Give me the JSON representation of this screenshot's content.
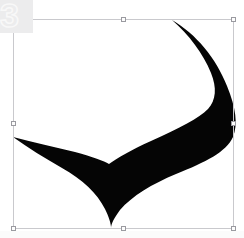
{
  "app": {
    "surface_name": "vector-canvas",
    "background_color": "#ffffff"
  },
  "watermark": {
    "label": "3",
    "block_color": "#ececed",
    "text_color": "#f8f8f8"
  },
  "selection": {
    "label": "",
    "stroke_color": "#c9c9cd",
    "handle_fill": "#fdfdfd",
    "handle_stroke": "#9a9aa0",
    "bounds": {
      "x": 13,
      "y": 19,
      "width": 221,
      "height": 210
    },
    "handles": [
      {
        "name": "handle-top-left",
        "position": "nw"
      },
      {
        "name": "handle-top-center",
        "position": "n"
      },
      {
        "name": "handle-top-right",
        "position": "ne"
      },
      {
        "name": "handle-middle-left",
        "position": "w"
      },
      {
        "name": "handle-middle-right",
        "position": "e"
      },
      {
        "name": "handle-bottom-left",
        "position": "sw"
      },
      {
        "name": "handle-bottom-center",
        "position": "s"
      },
      {
        "name": "handle-bottom-right",
        "position": "se"
      }
    ]
  },
  "artwork": {
    "shape_name": "swoosh-checkmark-shape",
    "fill_color": "#050505",
    "path": "M 172 20 C 196 34 216 58 227 86 C 236 108 238 124 233 137 C 226 152 206 162 176 174 C 152 184 132 196 120 210 C 114 218 111 224 111 228 C 111 224 109 217 105 209 C 97 193 83 180 62 168 C 45 158 28 148 13 137 C 32 142 54 147 75 152 C 93 157 104 161 109 164 C 117 158 131 150 151 141 C 180 128 199 118 208 109 C 216 100 217 88 211 73 C 203 53 189 35 172 20 Z"
  }
}
